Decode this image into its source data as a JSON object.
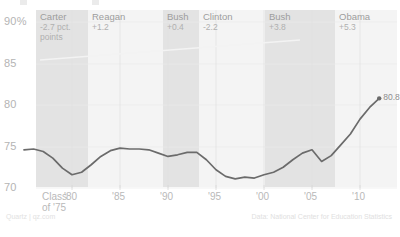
{
  "chart_data": {
    "type": "line",
    "title": "",
    "xlabel": "",
    "ylabel": "",
    "ylim": [
      68.5,
      91
    ],
    "xlim": [
      1975,
      2013
    ],
    "grid": true,
    "legend_position": "none",
    "y_ticks": [
      "90%",
      "85",
      "80",
      "75",
      "70"
    ],
    "y_tick_values": [
      90,
      85,
      80,
      75,
      70
    ],
    "x_ticks": [
      "'80",
      "'85",
      "'90",
      "'95",
      "'00",
      "'05",
      "'10"
    ],
    "x_tick_values": [
      1980,
      1985,
      1990,
      1995,
      2000,
      2005,
      2010
    ],
    "x_origin_label_line1": "Class",
    "x_origin_label_line2": "of '75",
    "series_name": "High school graduation rate",
    "x": [
      1975,
      1976,
      1977,
      1978,
      1979,
      1980,
      1981,
      1982,
      1983,
      1984,
      1985,
      1986,
      1987,
      1988,
      1989,
      1990,
      1991,
      1992,
      1993,
      1994,
      1995,
      1996,
      1997,
      1998,
      1999,
      2000,
      2001,
      2002,
      2003,
      2004,
      2005,
      2006,
      2007,
      2008,
      2009,
      2010,
      2011,
      2012
    ],
    "values": [
      74.6,
      74.7,
      74.4,
      73.6,
      72.4,
      71.6,
      71.9,
      72.8,
      73.8,
      74.5,
      74.8,
      74.7,
      74.7,
      74.6,
      74.2,
      73.8,
      74.0,
      74.3,
      74.3,
      73.4,
      72.2,
      71.4,
      71.1,
      71.3,
      71.2,
      71.6,
      71.9,
      72.5,
      73.4,
      74.2,
      74.6,
      73.2,
      73.9,
      75.2,
      76.5,
      78.3,
      79.7,
      80.8
    ],
    "endpoint_label": "80.8",
    "endpoint_x": 2012,
    "endpoint_y": 80.8,
    "line_color": "#6b6b6b",
    "band_color": "#e4e4e4",
    "grid_color": "#ececec",
    "annotations": [
      {
        "name": "Carter",
        "delta": "-2.7 pct.",
        "delta2": "points",
        "start": 1977,
        "end": 1981,
        "shaded": true
      },
      {
        "name": "Reagan",
        "delta": "+1.2",
        "delta2": "",
        "start": 1981,
        "end": 1989,
        "shaded": false
      },
      {
        "name": "Bush",
        "delta": "+0.4",
        "delta2": "",
        "start": 1989,
        "end": 1993,
        "shaded": true
      },
      {
        "name": "Clinton",
        "delta": "-2.2",
        "delta2": "",
        "start": 1993,
        "end": 2001,
        "shaded": false
      },
      {
        "name": "Bush",
        "delta": "+3.8",
        "delta2": "",
        "start": 2001,
        "end": 2009,
        "shaded": true
      },
      {
        "name": "Obama",
        "delta": "+5.3",
        "delta2": "",
        "start": 2009,
        "end": 2013,
        "shaded": false
      }
    ]
  },
  "credits": {
    "left": "Quartz | qz.com",
    "right": "Data: National Center for Education Statistics"
  }
}
